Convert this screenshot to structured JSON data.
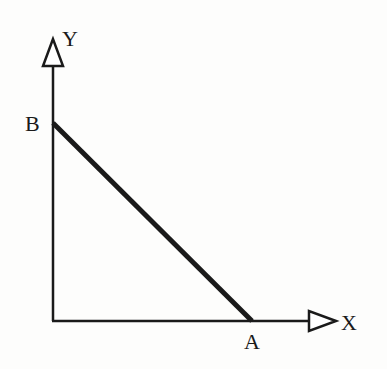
{
  "diagram": {
    "type": "axes-with-line-segment",
    "axes": {
      "x_label": "X",
      "y_label": "Y"
    },
    "points": {
      "A": {
        "label": "A",
        "on_axis": "X"
      },
      "B": {
        "label": "B",
        "on_axis": "Y"
      }
    },
    "segment": {
      "from": "B",
      "to": "A"
    },
    "colors": {
      "background": "#fdfdfc",
      "ink": "#1a1a1a"
    }
  }
}
